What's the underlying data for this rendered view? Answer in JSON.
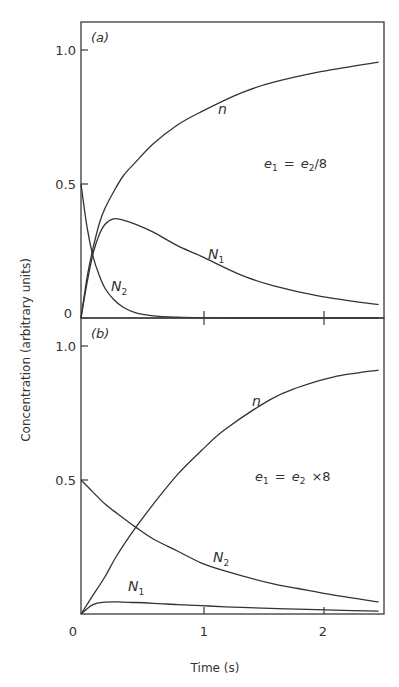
{
  "chart_data": [
    {
      "panel": "(a)",
      "type": "line",
      "annotation": "e1 = e2/8",
      "xlabel": "Time (s)",
      "ylabel": "Concentration (arbitrary units)",
      "xlim": [
        0,
        2.5
      ],
      "ylim": [
        0,
        1.1
      ],
      "xticks": [
        "0",
        "1",
        "2"
      ],
      "yticks": [
        "0",
        "0.5",
        "1.0"
      ],
      "grid": false,
      "series": [
        {
          "name": "n",
          "x": [
            0,
            0.05,
            0.1,
            0.15,
            0.2,
            0.27,
            0.35,
            0.45,
            0.6,
            0.8,
            1.0,
            1.33,
            1.6,
            2.0,
            2.47
          ],
          "y": [
            0,
            0.15,
            0.26,
            0.35,
            0.41,
            0.47,
            0.53,
            0.58,
            0.65,
            0.72,
            0.77,
            0.84,
            0.88,
            0.92,
            0.955
          ]
        },
        {
          "name": "N1",
          "x": [
            0,
            0.05,
            0.1,
            0.15,
            0.2,
            0.27,
            0.35,
            0.45,
            0.6,
            0.8,
            1.0,
            1.33,
            1.6,
            2.0,
            2.47
          ],
          "y": [
            0,
            0.13,
            0.24,
            0.31,
            0.35,
            0.37,
            0.365,
            0.35,
            0.32,
            0.27,
            0.23,
            0.16,
            0.12,
            0.08,
            0.05
          ]
        },
        {
          "name": "N2",
          "x": [
            0,
            0.05,
            0.1,
            0.15,
            0.2,
            0.27,
            0.35,
            0.45,
            0.6,
            0.8,
            1.0,
            1.33,
            1.6,
            2.0,
            2.47
          ],
          "y": [
            0.5,
            0.34,
            0.23,
            0.16,
            0.11,
            0.07,
            0.04,
            0.02,
            0.008,
            0.003,
            0.001,
            0,
            0,
            0,
            0
          ]
        }
      ]
    },
    {
      "panel": "(b)",
      "type": "line",
      "annotation": "e1 = e2 × 8",
      "xlabel": "Time (s)",
      "ylabel": "Concentration (arbitrary units)",
      "xlim": [
        0,
        2.5
      ],
      "ylim": [
        0,
        1.1
      ],
      "xticks": [
        "0",
        "1",
        "2"
      ],
      "yticks": [
        "0",
        "0.5",
        "1.0"
      ],
      "grid": false,
      "series": [
        {
          "name": "n",
          "x": [
            0,
            0.1,
            0.2,
            0.3,
            0.45,
            0.6,
            0.8,
            1.0,
            1.2,
            1.57,
            1.8,
            2.1,
            2.47
          ],
          "y": [
            0,
            0.07,
            0.14,
            0.22,
            0.32,
            0.41,
            0.52,
            0.61,
            0.69,
            0.8,
            0.845,
            0.885,
            0.91
          ]
        },
        {
          "name": "N1",
          "x": [
            0,
            0.1,
            0.2,
            0.3,
            0.45,
            0.6,
            0.8,
            1.0,
            1.2,
            1.57,
            1.8,
            2.1,
            2.47
          ],
          "y": [
            0,
            0.035,
            0.044,
            0.045,
            0.043,
            0.04,
            0.035,
            0.031,
            0.027,
            0.021,
            0.018,
            0.014,
            0.011
          ]
        },
        {
          "name": "N2",
          "x": [
            0,
            0.1,
            0.2,
            0.3,
            0.45,
            0.6,
            0.8,
            1.0,
            1.2,
            1.57,
            1.8,
            2.1,
            2.47
          ],
          "y": [
            0.5,
            0.455,
            0.41,
            0.375,
            0.325,
            0.28,
            0.235,
            0.19,
            0.16,
            0.115,
            0.095,
            0.07,
            0.045
          ]
        }
      ]
    }
  ],
  "labels": {
    "panel_a": "(a)",
    "panel_b": "(b)",
    "ylabel": "Concentration  (arbitrary  units)",
    "xlabel": "Time  (s)",
    "y_1": "1.0",
    "y_05": "0.5",
    "y_0": "0",
    "x_0": "0",
    "x_1": "1",
    "x_2": "2",
    "n": "n",
    "N": "N",
    "sub1": "1",
    "sub2": "2",
    "e": "e",
    "eq_a_rest": "/8",
    "eq_b_rest": "×8",
    "equals": "="
  }
}
